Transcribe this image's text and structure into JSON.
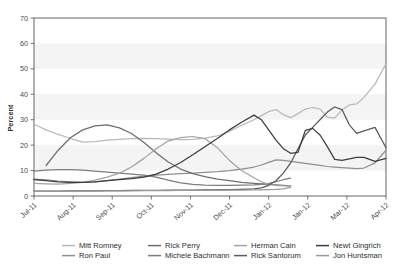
{
  "chart_data": {
    "type": "line",
    "title": "",
    "xlabel": "",
    "ylabel": "Percent",
    "ylim": [
      0,
      70
    ],
    "yticks": [
      0,
      10,
      20,
      30,
      40,
      50,
      60,
      70
    ],
    "xticks": [
      "Jul-11",
      "Aug-11",
      "Sep-11",
      "Oct-11",
      "Nov-11",
      "Dec-11",
      "Jan-12",
      "Jan-12",
      "Mar-12",
      "Apr-12"
    ],
    "grid": false,
    "legend_position": "bottom",
    "x": [
      0,
      0.33,
      0.66,
      1,
      1.33,
      1.66,
      2,
      2.33,
      2.66,
      3,
      3.33,
      3.66,
      4,
      4.33,
      4.66,
      5,
      5.33,
      5.66,
      6,
      6.2,
      6.4,
      6.6,
      6.8,
      7,
      7.2,
      7.4,
      7.6,
      7.8,
      8,
      8.2,
      8.4,
      8.6,
      8.8,
      9,
      9.3,
      9.6
    ],
    "series": [
      {
        "name": "Mitt Romney",
        "color": "#b9b9b9",
        "values": [
          28.2,
          26.0,
          24.2,
          22.6,
          21.2,
          21.4,
          22.0,
          22.3,
          22.6,
          22.7,
          22.6,
          22.4,
          22.2,
          22.3,
          22.8,
          23.6,
          25.4,
          27.8,
          30.0,
          31.6,
          33.2,
          34.0,
          32.0,
          30.8,
          32.4,
          34.2,
          34.8,
          34.2,
          31.0,
          30.6,
          33.8,
          35.8,
          36.2,
          38.8,
          44.0,
          52.0
        ]
      },
      {
        "name": "Ron Paul",
        "color": "#8f8f8f",
        "values": [
          6.6,
          6.3,
          5.9,
          5.6,
          5.4,
          5.6,
          6.0,
          6.6,
          7.2,
          7.8,
          8.2,
          8.5,
          8.8,
          9.0,
          9.3,
          9.6,
          10.0,
          10.6,
          11.4,
          12.2,
          13.2,
          14.2,
          14.0,
          13.6,
          13.2,
          12.8,
          12.4,
          12.0,
          11.6,
          11.4,
          11.2,
          11.0,
          10.8,
          11.0,
          13.0,
          18.0
        ]
      },
      {
        "name": "Rick Perry",
        "color": "#6e6e6e",
        "values": [
          null,
          12.0,
          18.0,
          23.0,
          26.0,
          27.6,
          28.0,
          26.8,
          24.6,
          21.0,
          17.0,
          13.4,
          10.6,
          8.8,
          7.6,
          6.6,
          6.0,
          5.4,
          5.0,
          4.8,
          4.6,
          4.4,
          4.2,
          4.0,
          null,
          null,
          null,
          null,
          null,
          null,
          null,
          null,
          null,
          null,
          null,
          null
        ]
      },
      {
        "name": "Michele Bachmann",
        "color": "#7d7d7d",
        "values": [
          9.8,
          10.2,
          10.4,
          10.4,
          10.2,
          9.8,
          9.4,
          9.0,
          8.6,
          8.2,
          7.4,
          6.2,
          5.2,
          4.6,
          4.3,
          4.2,
          4.2,
          4.3,
          4.4,
          4.6,
          5.0,
          5.6,
          6.4,
          7.0,
          null,
          null,
          null,
          null,
          null,
          null,
          null,
          null,
          null,
          null,
          null,
          null
        ]
      },
      {
        "name": "Herman Cain",
        "color": "#a3a3a3",
        "values": [
          5.0,
          4.8,
          4.7,
          5.0,
          5.4,
          6.2,
          7.4,
          9.0,
          11.4,
          14.8,
          18.6,
          21.6,
          23.0,
          23.4,
          22.6,
          19.0,
          14.0,
          10.0,
          7.2,
          5.6,
          4.6,
          4.2,
          4.0,
          4.0,
          null,
          null,
          null,
          null,
          null,
          null,
          null,
          null,
          null,
          null,
          null,
          null
        ]
      },
      {
        "name": "Rick Santorum",
        "color": "#5a5a5a",
        "values": [
          1.9,
          1.9,
          1.9,
          2.0,
          2.0,
          2.0,
          2.1,
          2.1,
          2.2,
          2.2,
          2.2,
          2.3,
          2.3,
          2.3,
          2.4,
          2.4,
          2.5,
          2.6,
          2.8,
          3.2,
          4.2,
          6.0,
          9.0,
          13.0,
          18.6,
          24.0,
          27.0,
          30.0,
          33.0,
          35.0,
          34.0,
          28.0,
          24.6,
          25.6,
          27.0,
          19.0
        ]
      },
      {
        "name": "Newt Gingrich",
        "color": "#3d3d3d",
        "values": [
          6.4,
          6.0,
          5.6,
          5.4,
          5.4,
          5.6,
          6.0,
          6.4,
          6.8,
          7.4,
          8.6,
          10.6,
          13.2,
          16.2,
          19.4,
          22.6,
          26.0,
          29.0,
          31.8,
          30.0,
          26.0,
          22.0,
          18.6,
          16.8,
          17.2,
          25.8,
          26.6,
          24.0,
          19.4,
          14.4,
          14.0,
          14.6,
          15.2,
          15.2,
          13.6,
          14.8
        ]
      },
      {
        "name": "Jon Huntsman",
        "color": "#9a9a9a",
        "values": [
          1.8,
          1.8,
          1.8,
          1.9,
          1.9,
          1.9,
          2.0,
          2.0,
          2.0,
          2.1,
          2.1,
          2.1,
          2.2,
          2.2,
          2.2,
          2.2,
          2.3,
          2.3,
          2.4,
          2.4,
          2.5,
          2.6,
          2.8,
          3.4,
          null,
          null,
          null,
          null,
          null,
          null,
          null,
          null,
          null,
          null,
          null,
          null
        ]
      }
    ]
  },
  "legend": {
    "entries": [
      {
        "label": "Mitt Romney"
      },
      {
        "label": "Rick Perry"
      },
      {
        "label": "Herman Cain"
      },
      {
        "label": "Newt Gingrich"
      },
      {
        "label": "Ron Paul"
      },
      {
        "label": "Michele Bachmann"
      },
      {
        "label": "Rick Santorum"
      },
      {
        "label": "Jon Huntsman"
      }
    ]
  },
  "style": {
    "band_color": "#f4f4f4",
    "plot_background": "#ffffff",
    "axis_color": "#555555"
  }
}
